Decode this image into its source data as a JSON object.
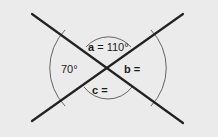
{
  "diagram": {
    "angles": {
      "a": {
        "variable": "a",
        "equals": "=",
        "value": "110°",
        "text": "a = 110°"
      },
      "left": {
        "value": "70°",
        "text": "70°"
      },
      "b": {
        "variable": "b",
        "equals": "=",
        "value": "",
        "text": "b ="
      },
      "c": {
        "variable": "c",
        "equals": "=",
        "value": "",
        "text": "c ="
      }
    },
    "colors": {
      "background": "#ebebeb",
      "line": "#222222",
      "arc": "#555555",
      "text": "#1c1c1c"
    }
  }
}
